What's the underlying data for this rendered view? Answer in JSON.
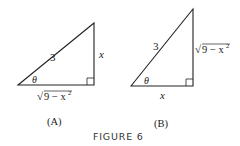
{
  "figure": {
    "caption": "FIGURE 6",
    "panels": [
      {
        "id": "A",
        "label": "(A)",
        "hypotenuse": "3",
        "angle": "θ",
        "opposite": "x",
        "adjacent_radicand": "9 − x",
        "adjacent_exp": "2",
        "sqrt": "√"
      },
      {
        "id": "B",
        "label": "(B)",
        "hypotenuse": "3",
        "angle": "θ",
        "opposite_radicand": "9 − x",
        "opposite_exp": "2",
        "adjacent": "x",
        "sqrt": "√"
      }
    ]
  }
}
